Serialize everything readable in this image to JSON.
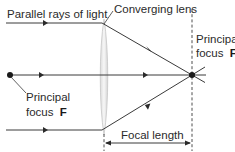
{
  "diagram": {
    "type": "optics-ray-diagram",
    "labels": {
      "parallel_rays": "Parallel rays of light",
      "lens": "Converging lens",
      "focus_right_line1": "Principal",
      "focus_right_line2": "focus ",
      "focus_right_symbol": "F",
      "focus_left_line1": "Principal",
      "focus_left_line2": "focus ",
      "focus_left_symbol": "F",
      "focal_length": "Focal length"
    },
    "colors": {
      "ray": "#3a3a3a",
      "text": "#2a2a2a",
      "lens_fill": "#eeeeee",
      "lens_edge": "#c8c8c8"
    }
  }
}
